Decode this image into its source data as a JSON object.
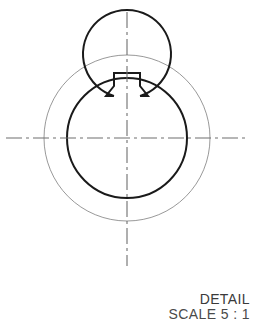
{
  "drawing": {
    "type": "cad-detail-view",
    "title": "DETAIL",
    "scale_note": "SCALE 5 : 1",
    "center": {
      "x": 127,
      "y": 138
    },
    "colors": {
      "outer_circle": "#8d8d8d",
      "middle_circle": "#1a1a1a",
      "inner_profile": "#1a1a1a",
      "centerline": "#6e6e6e",
      "text": "#3a3a3a",
      "background": "#ffffff"
    },
    "circles": [
      {
        "name": "outer-boundary-circle",
        "radius": 83,
        "stroke_width": 0.9,
        "style": "thin"
      },
      {
        "name": "middle-bore-circle",
        "radius": 60,
        "stroke_width": 2.0,
        "style": "thick"
      },
      {
        "name": "inner-bore-circle",
        "radius": 44,
        "stroke_width": 2.0,
        "style": "thick"
      }
    ],
    "keyway": {
      "name": "keyway-notch",
      "top_y": 73,
      "half_width": 13,
      "shoulder_y": 96,
      "shoulder_half_width": 21,
      "stroke_width": 2.0
    },
    "centerlines": {
      "horizontal": {
        "x1": 6,
        "x2": 248,
        "y": 138
      },
      "vertical": {
        "y1": 12,
        "y2": 266,
        "x": 127
      },
      "dash_pattern": "16 4 3 4"
    }
  }
}
